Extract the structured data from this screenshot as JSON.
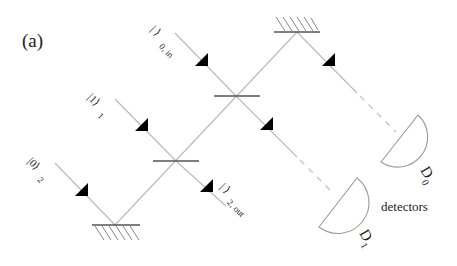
{
  "panel_label": "(a)",
  "inputs": [
    {
      "ket": "| ⟩",
      "subscript": "0, in"
    },
    {
      "ket": "|1⟩",
      "subscript": "1"
    },
    {
      "ket": "|0⟩",
      "subscript": "2"
    }
  ],
  "output": {
    "ket": "| ⟩",
    "subscript": "2, out"
  },
  "detectors": [
    {
      "label": "D",
      "subscript": "0"
    },
    {
      "label": "D",
      "subscript": "1"
    }
  ],
  "detectors_caption": "detectors",
  "colors": {
    "beam": "#b9b9b9",
    "optic": "#555555",
    "arrow": "#000000"
  }
}
